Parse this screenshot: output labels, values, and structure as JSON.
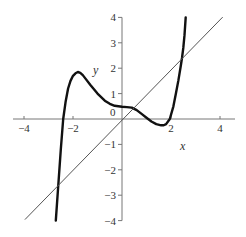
{
  "chart_data": {
    "type": "line",
    "title": "",
    "xlabel": "x",
    "ylabel": "y",
    "xlim": [
      -4.4,
      4.6
    ],
    "ylim": [
      -4,
      4
    ],
    "grid": false,
    "legend": null,
    "x_ticks": [
      -4,
      -2,
      2,
      4
    ],
    "x_tick_labels": [
      "−4",
      "−2",
      "2",
      "4"
    ],
    "y_ticks": [
      -4,
      -3,
      -2,
      -1,
      1,
      2,
      3,
      4
    ],
    "y_tick_labels": [
      "−4",
      "−3",
      "−2",
      "−1",
      "1",
      "2",
      "3",
      "4"
    ],
    "origin_label": "0",
    "series": [
      {
        "name": "curve",
        "style": "thick",
        "color": "#111111",
        "x": [
          -2.7,
          -2.6,
          -2.5,
          -2.4,
          -2.3,
          -2.2,
          -2.1,
          -2.0,
          -1.9,
          -1.8,
          -1.7,
          -1.6,
          -1.5,
          -1.3,
          -1.0,
          -0.7,
          -0.5,
          -0.3,
          0.0,
          0.2,
          0.4,
          0.6,
          0.8,
          1.0,
          1.2,
          1.4,
          1.6,
          1.7,
          1.8,
          1.95,
          2.1,
          2.2,
          2.3,
          2.4,
          2.45,
          2.5,
          2.55,
          2.6
        ],
        "y": [
          -4.0,
          -2.6,
          -1.2,
          0.0,
          0.7,
          1.2,
          1.5,
          1.7,
          1.8,
          1.85,
          1.82,
          1.73,
          1.6,
          1.35,
          1.0,
          0.72,
          0.6,
          0.52,
          0.48,
          0.47,
          0.45,
          0.35,
          0.2,
          0.05,
          -0.1,
          -0.2,
          -0.25,
          -0.25,
          -0.2,
          0.0,
          0.5,
          1.0,
          1.5,
          2.1,
          2.4,
          2.8,
          3.3,
          4.0
        ]
      },
      {
        "name": "y = x",
        "style": "thin",
        "color": "#555555",
        "x": [
          -3.95,
          4.1
        ],
        "y": [
          -3.95,
          4.0
        ]
      }
    ]
  }
}
